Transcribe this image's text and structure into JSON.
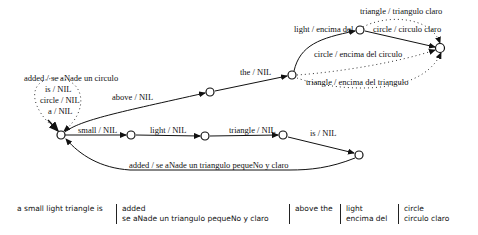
{
  "diagram": {
    "type": "finite-state transducer",
    "states": [
      {
        "id": "start",
        "x": 61,
        "y": 135
      },
      {
        "id": "s_small",
        "x": 131,
        "y": 135
      },
      {
        "id": "s_above",
        "x": 210,
        "y": 92
      },
      {
        "id": "s_light",
        "x": 205,
        "y": 136
      },
      {
        "id": "s_the",
        "x": 292,
        "y": 75
      },
      {
        "id": "s_tri",
        "x": 283,
        "y": 135
      },
      {
        "id": "s_is",
        "x": 359,
        "y": 155
      },
      {
        "id": "s_enc",
        "x": 360,
        "y": 30
      },
      {
        "id": "s_final",
        "x": 440,
        "y": 48
      }
    ],
    "edges": {
      "added_circulo": "added / se aNade un circulo",
      "is": "is / NIL",
      "circle": "circle / NIL",
      "a": "a / NIL",
      "above": "above / NIL",
      "the": "the / NIL",
      "light_encima": "light / encima del",
      "triangle_claro": "triangle / triangulo claro",
      "circle_claro": "circle / circulo claro",
      "circle_encima": "circle / encima del circulo",
      "triangle_encima": "triangle / encima del triangulo",
      "small": "small / NIL",
      "light": "light / NIL",
      "triangle": "triangle / NIL",
      "is2": "is / NIL",
      "added_triangulo": "added / se aNade un triangulo pequeNo y claro"
    }
  },
  "table": {
    "col1": "a small light triangle is",
    "col2_line1": "added",
    "col2_line2": "se aNade un triangulo pequeNo y claro",
    "col3_line1": "above the",
    "col4_line1": "light",
    "col4_line2": "encima del",
    "col5_line1": "circle",
    "col5_line2": "circulo claro"
  }
}
